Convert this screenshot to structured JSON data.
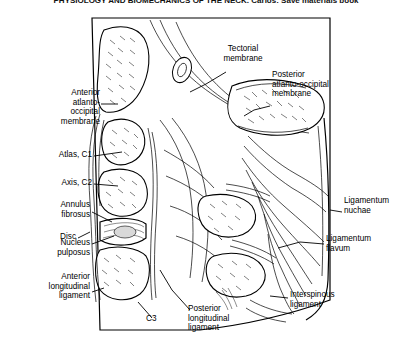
{
  "figure": {
    "title": "PHYSIOLOGY AND BIOMECHANICS OF THE NECK. Carlos: Save materials book",
    "type": "anatomical-illustration"
  },
  "labels": [
    {
      "id": "tectorial-membrane",
      "text": "Tectorial\nmembrane",
      "side": "top"
    },
    {
      "id": "posterior-atlanto-occipital-membrane",
      "text": "Posterior\natlanto-occipital\nmembrane",
      "side": "right"
    },
    {
      "id": "anterior-atlanto-occipital-membrane",
      "text": "Anterior\natlanto-\noccipital\nmembrane",
      "side": "left"
    },
    {
      "id": "atlas-c1",
      "text": "Atlas, C1",
      "side": "left"
    },
    {
      "id": "axis-c2",
      "text": "Axis, C2",
      "side": "left"
    },
    {
      "id": "annulus-fibrosus",
      "text": "Annulus\nfibrosus",
      "side": "left"
    },
    {
      "id": "disc",
      "text": "Disc",
      "side": "left"
    },
    {
      "id": "nucleus-pulposus",
      "text": "Nucleus\npulposus",
      "side": "left"
    },
    {
      "id": "anterior-longitudinal-ligament",
      "text": "Anterior\nlongitudinal\nligament",
      "side": "left"
    },
    {
      "id": "c3",
      "text": "C3",
      "side": "bottom"
    },
    {
      "id": "posterior-longitudinal-ligament",
      "text": "Posterior\nlongitudinal\nligament",
      "side": "bottom"
    },
    {
      "id": "interspinous-ligament",
      "text": "Interspinous\nligament",
      "side": "right"
    },
    {
      "id": "ligamentum-flavum",
      "text": "Ligamentum\nflavum",
      "side": "right"
    },
    {
      "id": "ligamentum-nuchae",
      "text": "Ligamentum\nnuchae",
      "side": "right"
    }
  ],
  "colors": {
    "ink": "#000000",
    "paper": "#ffffff",
    "shade": "#d9d9d9"
  }
}
